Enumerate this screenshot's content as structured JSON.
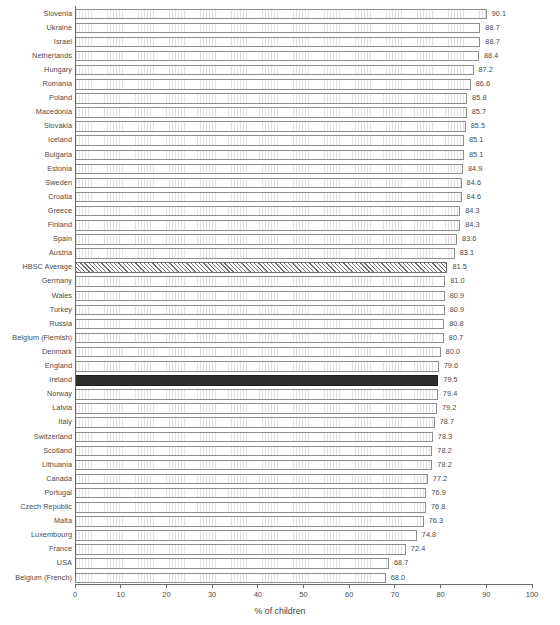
{
  "chart_data": {
    "type": "bar",
    "orientation": "horizontal",
    "title": "",
    "subtitle": "",
    "xlabel": "% of children",
    "ylabel": "",
    "xlim": [
      0,
      100
    ],
    "grid": false,
    "legend": null,
    "xticks": [
      0,
      10,
      20,
      30,
      40,
      50,
      60,
      70,
      80,
      90,
      100
    ],
    "xtick_labels": [
      "0",
      "10",
      "20",
      "30",
      "40",
      "50",
      "60",
      "70",
      "80",
      "90",
      "100"
    ],
    "categories": [
      "Slovenia",
      "Ukraine",
      "Israel",
      "Netherlands",
      "Hungary",
      "Romania",
      "Poland",
      "Macedonia",
      "Slovakia",
      "Iceland",
      "Bulgaria",
      "Estonia",
      "Sweden",
      "Croatia",
      "Greece",
      "Finland",
      "Spain",
      "Austria",
      "HBSC Average",
      "Germany",
      "Wales",
      "Turkey",
      "Russia",
      "Belgium (Flemish)",
      "Denmark",
      "England",
      "Ireland",
      "Norway",
      "Latvia",
      "Italy",
      "Switzerland",
      "Scotland",
      "Lithuania",
      "Canada",
      "Portugal",
      "Czech Republic",
      "Malta",
      "Luxembourg",
      "France",
      "USA",
      "Belgium (French)"
    ],
    "values": [
      90.1,
      88.7,
      88.7,
      88.4,
      87.2,
      86.6,
      85.8,
      85.7,
      85.5,
      85.1,
      85.1,
      84.9,
      84.6,
      84.6,
      84.3,
      84.3,
      83.6,
      83.1,
      81.5,
      81.0,
      80.9,
      80.9,
      80.8,
      80.7,
      80.0,
      79.6,
      79.5,
      79.4,
      79.2,
      78.7,
      78.3,
      78.2,
      78.2,
      77.2,
      76.9,
      76.8,
      76.3,
      74.8,
      72.4,
      68.7,
      68.0
    ],
    "value_labels": [
      "90.1",
      "88.7",
      "88.7",
      "88.4",
      "87.2",
      "86.6",
      "85.8",
      "85.7",
      "85.5",
      "85.1",
      "85.1",
      "84.9",
      "84.6",
      "84.6",
      "84.3",
      "84.3",
      "83.6",
      "83.1",
      "81.5",
      "81.0",
      "80.9",
      "80.9",
      "80.8",
      "80.7",
      "80.0",
      "79.6",
      "79.5",
      "79.4",
      "79.2",
      "78.7",
      "78.3",
      "78.2",
      "78.2",
      "77.2",
      "76.9",
      "76.8",
      "76.3",
      "74.8",
      "72.4",
      "68.7",
      "68.0"
    ],
    "styles": [
      "plain",
      "plain",
      "plain",
      "plain",
      "plain",
      "plain",
      "plain",
      "plain",
      "plain",
      "plain",
      "plain",
      "plain",
      "plain",
      "plain",
      "plain",
      "plain",
      "plain",
      "plain",
      "hatched",
      "plain",
      "plain",
      "plain",
      "plain",
      "plain",
      "plain",
      "plain",
      "highlight",
      "plain",
      "plain",
      "plain",
      "plain",
      "plain",
      "plain",
      "plain",
      "plain",
      "plain",
      "plain",
      "plain",
      "plain",
      "plain",
      "plain"
    ],
    "colors": {
      "bar_fill": "#ffffff",
      "bar_edge": "#8d8d8d",
      "highlight_fill": "#2f2f2f",
      "hatch_color": "#6f6f6f",
      "axis": "#6b6b6b",
      "text": "#4b4b4b"
    }
  }
}
